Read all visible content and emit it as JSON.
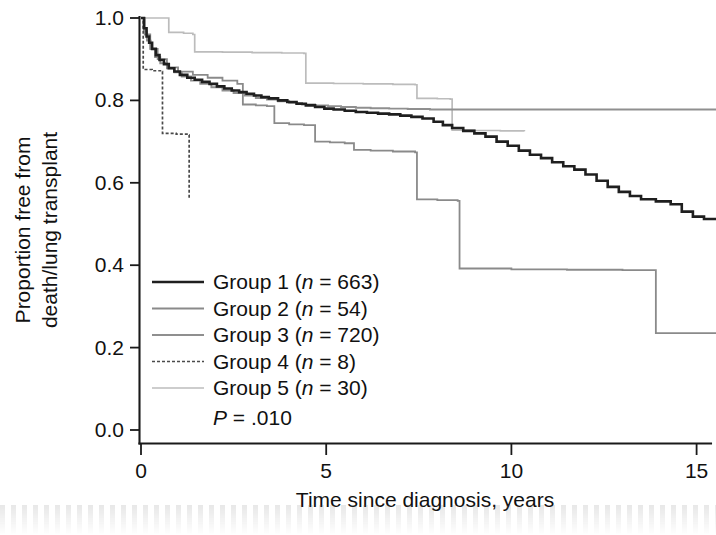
{
  "chart_data": {
    "type": "line",
    "subtype": "kaplan-meier-step",
    "title": "",
    "xlabel": "Time since diagnosis, years",
    "ylabel": "Proportion free from death/lung transplant",
    "xlim": [
      0,
      15.6
    ],
    "ylim": [
      0.0,
      1.0
    ],
    "xticks": [
      0,
      5,
      10,
      15
    ],
    "xtick_labels": [
      "0",
      "5",
      "10",
      "15"
    ],
    "yticks": [
      0.0,
      0.2,
      0.4,
      0.6,
      0.8,
      1.0
    ],
    "ytick_labels": [
      "0.0",
      "0.2",
      "0.4",
      "0.6",
      "0.8",
      "1.0"
    ],
    "grid": false,
    "legend_position": "inside-lower-left",
    "annotation": "P = .010",
    "p_value": ".010",
    "series": [
      {
        "name": "Group 1",
        "label": "Group 1 (n = 663)",
        "n": 663,
        "color": "#1f1f1f",
        "width": 2.6,
        "dash": "none",
        "points": [
          [
            0.0,
            1.0
          ],
          [
            0.08,
            0.975
          ],
          [
            0.15,
            0.955
          ],
          [
            0.22,
            0.94
          ],
          [
            0.3,
            0.925
          ],
          [
            0.4,
            0.91
          ],
          [
            0.5,
            0.898
          ],
          [
            0.62,
            0.888
          ],
          [
            0.75,
            0.878
          ],
          [
            0.9,
            0.87
          ],
          [
            1.05,
            0.862
          ],
          [
            1.25,
            0.855
          ],
          [
            1.45,
            0.85
          ],
          [
            1.65,
            0.845
          ],
          [
            1.85,
            0.84
          ],
          [
            2.05,
            0.834
          ],
          [
            2.25,
            0.829
          ],
          [
            2.45,
            0.824
          ],
          [
            2.65,
            0.82
          ],
          [
            2.85,
            0.816
          ],
          [
            3.05,
            0.812
          ],
          [
            3.25,
            0.808
          ],
          [
            3.45,
            0.805
          ],
          [
            3.7,
            0.8
          ],
          [
            3.95,
            0.796
          ],
          [
            4.2,
            0.792
          ],
          [
            4.45,
            0.788
          ],
          [
            4.7,
            0.784
          ],
          [
            4.95,
            0.78
          ],
          [
            5.2,
            0.778
          ],
          [
            5.5,
            0.775
          ],
          [
            5.8,
            0.772
          ],
          [
            6.1,
            0.77
          ],
          [
            6.4,
            0.768
          ],
          [
            6.7,
            0.766
          ],
          [
            7.0,
            0.763
          ],
          [
            7.3,
            0.76
          ],
          [
            7.6,
            0.756
          ],
          [
            7.9,
            0.748
          ],
          [
            8.15,
            0.74
          ],
          [
            8.4,
            0.733
          ],
          [
            8.7,
            0.726
          ],
          [
            9.0,
            0.72
          ],
          [
            9.3,
            0.712
          ],
          [
            9.6,
            0.7
          ],
          [
            9.9,
            0.69
          ],
          [
            10.2,
            0.678
          ],
          [
            10.5,
            0.668
          ],
          [
            10.8,
            0.66
          ],
          [
            11.1,
            0.65
          ],
          [
            11.4,
            0.64
          ],
          [
            11.7,
            0.632
          ],
          [
            12.0,
            0.62
          ],
          [
            12.3,
            0.605
          ],
          [
            12.6,
            0.59
          ],
          [
            12.9,
            0.578
          ],
          [
            13.2,
            0.568
          ],
          [
            13.5,
            0.56
          ],
          [
            13.9,
            0.555
          ],
          [
            14.3,
            0.548
          ],
          [
            14.6,
            0.53
          ],
          [
            14.9,
            0.518
          ],
          [
            15.2,
            0.512
          ],
          [
            15.55,
            0.512
          ]
        ],
        "end_value": 0.51
      },
      {
        "name": "Group 2",
        "label": "Group 2 (n = 54)",
        "n": 54,
        "color": "#8a8a8a",
        "width": 1.8,
        "dash": "none",
        "points": [
          [
            0.0,
            1.0
          ],
          [
            0.1,
            0.96
          ],
          [
            0.25,
            0.925
          ],
          [
            0.45,
            0.9
          ],
          [
            0.7,
            0.88
          ],
          [
            1.0,
            0.87
          ],
          [
            1.4,
            0.862
          ],
          [
            1.8,
            0.855
          ],
          [
            2.2,
            0.848
          ],
          [
            2.6,
            0.84
          ],
          [
            2.75,
            0.79
          ],
          [
            3.1,
            0.788
          ],
          [
            3.4,
            0.786
          ],
          [
            3.6,
            0.745
          ],
          [
            4.0,
            0.742
          ],
          [
            4.4,
            0.74
          ],
          [
            4.7,
            0.7
          ],
          [
            5.1,
            0.698
          ],
          [
            5.5,
            0.696
          ],
          [
            5.75,
            0.68
          ],
          [
            6.2,
            0.678
          ],
          [
            6.8,
            0.676
          ],
          [
            7.4,
            0.674
          ],
          [
            7.45,
            0.56
          ],
          [
            8.0,
            0.558
          ],
          [
            8.55,
            0.556
          ],
          [
            8.6,
            0.392
          ],
          [
            10.0,
            0.39
          ],
          [
            11.5,
            0.389
          ],
          [
            13.0,
            0.388
          ],
          [
            13.85,
            0.388
          ],
          [
            13.9,
            0.235
          ],
          [
            15.55,
            0.235
          ]
        ],
        "end_value": 0.235
      },
      {
        "name": "Group 3",
        "label": "Group 3 (n = 720)",
        "n": 720,
        "color": "#8f8f8f",
        "width": 1.9,
        "dash": "none",
        "points": [
          [
            0.0,
            1.0
          ],
          [
            0.08,
            0.968
          ],
          [
            0.16,
            0.945
          ],
          [
            0.26,
            0.925
          ],
          [
            0.38,
            0.905
          ],
          [
            0.52,
            0.89
          ],
          [
            0.7,
            0.878
          ],
          [
            0.9,
            0.868
          ],
          [
            1.1,
            0.858
          ],
          [
            1.35,
            0.848
          ],
          [
            1.6,
            0.84
          ],
          [
            1.9,
            0.832
          ],
          [
            2.2,
            0.824
          ],
          [
            2.5,
            0.818
          ],
          [
            2.8,
            0.812
          ],
          [
            3.1,
            0.806
          ],
          [
            3.4,
            0.802
          ],
          [
            3.7,
            0.798
          ],
          [
            4.0,
            0.794
          ],
          [
            4.35,
            0.79
          ],
          [
            4.7,
            0.788
          ],
          [
            5.05,
            0.786
          ],
          [
            5.4,
            0.784
          ],
          [
            5.8,
            0.782
          ],
          [
            6.2,
            0.781
          ],
          [
            6.7,
            0.78
          ],
          [
            7.2,
            0.779
          ],
          [
            7.8,
            0.778
          ],
          [
            8.5,
            0.778
          ],
          [
            9.5,
            0.778
          ],
          [
            10.5,
            0.778
          ],
          [
            11.5,
            0.778
          ],
          [
            12.5,
            0.778
          ],
          [
            13.5,
            0.778
          ],
          [
            14.5,
            0.778
          ],
          [
            15.55,
            0.778
          ]
        ],
        "end_value": 0.78
      },
      {
        "name": "Group 4",
        "label": "Group 4 (n = 8)",
        "n": 8,
        "color": "#4a4a4a",
        "width": 1.7,
        "dash": "3 2",
        "points": [
          [
            0.0,
            1.0
          ],
          [
            0.06,
            0.875
          ],
          [
            0.3,
            0.872
          ],
          [
            0.55,
            0.87
          ],
          [
            0.58,
            0.72
          ],
          [
            0.95,
            0.718
          ],
          [
            1.28,
            0.716
          ],
          [
            1.3,
            0.56
          ]
        ],
        "end_value": 0.56
      },
      {
        "name": "Group 5",
        "label": "Group 5 (n = 30)",
        "n": 30,
        "color": "#bcbcbc",
        "width": 1.7,
        "dash": "none",
        "points": [
          [
            0.0,
            1.0
          ],
          [
            0.35,
            1.0
          ],
          [
            0.72,
            1.0
          ],
          [
            0.75,
            0.965
          ],
          [
            1.15,
            0.963
          ],
          [
            1.4,
            0.96
          ],
          [
            1.45,
            0.918
          ],
          [
            2.2,
            0.917
          ],
          [
            3.0,
            0.916
          ],
          [
            3.8,
            0.915
          ],
          [
            4.4,
            0.914
          ],
          [
            4.45,
            0.842
          ],
          [
            5.2,
            0.841
          ],
          [
            6.0,
            0.84
          ],
          [
            6.8,
            0.839
          ],
          [
            7.4,
            0.838
          ],
          [
            7.45,
            0.805
          ],
          [
            8.0,
            0.804
          ],
          [
            8.35,
            0.803
          ],
          [
            8.4,
            0.728
          ],
          [
            9.0,
            0.727
          ],
          [
            9.7,
            0.726
          ],
          [
            10.35,
            0.725
          ]
        ],
        "end_value": 0.725
      }
    ]
  },
  "axes": {
    "y_title_line1": "Proportion free from",
    "y_title_line2": "death/lung transplant",
    "x_title": "Time since diagnosis, years"
  },
  "legend": {
    "entries": [
      {
        "prefix": "Group 1 (",
        "ital": "n",
        "suffix": " = 663)"
      },
      {
        "prefix": "Group 2 (",
        "ital": "n",
        "suffix": " = 54)"
      },
      {
        "prefix": "Group 3 (",
        "ital": "n",
        "suffix": " = 720)"
      },
      {
        "prefix": "Group 4 (",
        "ital": "n",
        "suffix": " = 8)"
      },
      {
        "prefix": "Group 5 (",
        "ital": "n",
        "suffix": " = 30)"
      }
    ],
    "pvalue_ital": "P",
    "pvalue_rest": " = .010"
  }
}
